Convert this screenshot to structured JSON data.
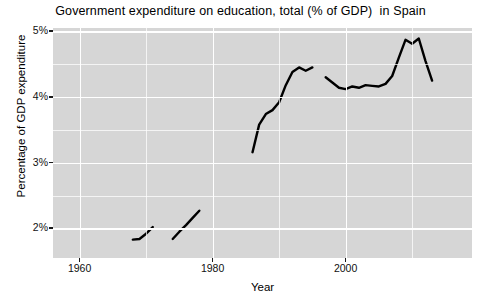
{
  "chart_data": {
    "type": "line",
    "title": "Government expenditure on education, total (% of GDP)  in Spain",
    "xlabel": "Year",
    "ylabel": "Percentage of GDP expenditure",
    "xlim": [
      1956,
      2019
    ],
    "ylim": [
      1.55,
      5.05
    ],
    "grid": true,
    "legend": "none",
    "x_ticks": [
      1960,
      1980,
      2000
    ],
    "x_tick_labels": [
      "1960",
      "1980",
      "2000"
    ],
    "y_ticks": [
      2,
      3,
      4,
      5
    ],
    "y_tick_labels": [
      "2%",
      "3%",
      "4%",
      "5%"
    ],
    "line_color": "#000000",
    "panel_color": "#d6d6d6",
    "grid_color": "#ffffff",
    "series": [
      {
        "name": "Government expenditure on education, total (% of GDP)",
        "segments": [
          {
            "name": "segment-1968-1971",
            "x": [
              1968,
              1969,
              1970,
              1971
            ],
            "y": [
              1.83,
              1.84,
              1.92,
              2.02
            ]
          },
          {
            "name": "segment-1974-1978",
            "x": [
              1974,
              1975,
              1976,
              1977,
              1978
            ],
            "y": [
              1.84,
              1.95,
              2.05,
              2.16,
              2.27
            ]
          },
          {
            "name": "segment-1986-1995",
            "x": [
              1986,
              1987,
              1988,
              1989,
              1990,
              1991,
              1992,
              1993,
              1994,
              1995
            ],
            "y": [
              3.16,
              3.58,
              3.74,
              3.8,
              3.92,
              4.18,
              4.38,
              4.45,
              4.4,
              4.45
            ]
          },
          {
            "name": "segment-1997-2013",
            "x": [
              1997,
              1998,
              1999,
              2000,
              2001,
              2002,
              2003,
              2004,
              2005,
              2006,
              2007,
              2008,
              2009,
              2010,
              2011,
              2012,
              2013
            ],
            "y": [
              4.3,
              4.22,
              4.14,
              4.12,
              4.16,
              4.14,
              4.18,
              4.17,
              4.16,
              4.2,
              4.32,
              4.6,
              4.87,
              4.81,
              4.89,
              4.55,
              4.25
            ]
          }
        ]
      }
    ]
  },
  "axes": {
    "y_ticks": [
      {
        "label": "5%",
        "value": 5
      },
      {
        "label": "4%",
        "value": 4
      },
      {
        "label": "3%",
        "value": 3
      },
      {
        "label": "2%",
        "value": 2
      }
    ],
    "x_ticks": [
      {
        "label": "1960",
        "value": 1960
      },
      {
        "label": "1980",
        "value": 1980
      },
      {
        "label": "2000",
        "value": 2000
      }
    ]
  }
}
